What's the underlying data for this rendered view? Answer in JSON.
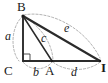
{
  "figure": {
    "type": "right-triangle-geometry-diagram",
    "background_color": "#ffffff",
    "ink_color": "#1a1a1a",
    "solid_stroke_color": "#2b2b2b",
    "dashed_stroke_color": "#8c8c8c",
    "right_angle_at": "C",
    "vertices": [
      {
        "id": "B",
        "label": "B",
        "x": 23,
        "y": 16,
        "label_x": 17,
        "label_y": 0
      },
      {
        "id": "C",
        "label": "C",
        "x": 23,
        "y": 61,
        "label_x": 5,
        "label_y": 66
      },
      {
        "id": "A",
        "label": "A",
        "x": 52,
        "y": 61,
        "label_x": 45,
        "label_y": 66
      },
      {
        "id": "D",
        "label": "I",
        "x": 100,
        "y": 61,
        "label_x": 100,
        "label_y": 64
      }
    ],
    "solid_edges": [
      {
        "name": "B-C",
        "from": "B",
        "to": "C"
      },
      {
        "name": "C-D",
        "from": "C",
        "to": "D"
      },
      {
        "name": "B-A",
        "from": "B",
        "to": "A"
      },
      {
        "name": "B-D",
        "from": "B",
        "to": "D"
      }
    ],
    "dashed_arcs": [
      {
        "name": "arc-a",
        "label": "a",
        "from": "B",
        "to": "C",
        "side": "left"
      },
      {
        "name": "arc-c",
        "label": "c",
        "from": "B",
        "to": "A",
        "side": "right"
      },
      {
        "name": "arc-e",
        "label": "e",
        "from": "B",
        "to": "D",
        "side": "above"
      },
      {
        "name": "arc-b",
        "label": "b",
        "from": "C",
        "to": "A",
        "side": "below"
      },
      {
        "name": "arc-d",
        "label": "d",
        "from": "A",
        "to": "D",
        "side": "below"
      }
    ],
    "segment_labels": [
      {
        "id": "a",
        "text": "a",
        "x": 6,
        "y": 31
      },
      {
        "id": "c",
        "text": "c",
        "x": 41,
        "y": 33
      },
      {
        "id": "e",
        "text": "e",
        "x": 64,
        "y": 23
      },
      {
        "id": "b",
        "text": "b",
        "x": 33,
        "y": 67
      },
      {
        "id": "d",
        "text": "d",
        "x": 71,
        "y": 67
      }
    ]
  }
}
